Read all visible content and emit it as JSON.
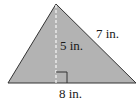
{
  "figure": {
    "shape": "triangle",
    "fill_color": "#b3b3b3",
    "stroke_color": "#333333",
    "vertices": {
      "left": [
        8,
        83
      ],
      "apex": [
        56,
        4
      ],
      "right": [
        136,
        83
      ]
    },
    "height_line": {
      "style": "dashed",
      "x": 56,
      "y1": 4,
      "y2": 83
    },
    "right_angle_marker": {
      "x": 56,
      "y": 72,
      "size": 11
    }
  },
  "labels": {
    "height": "5 in.",
    "side": "7 in.",
    "base": "8 in."
  }
}
